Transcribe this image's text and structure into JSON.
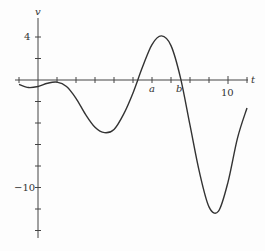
{
  "chart_data": {
    "type": "line",
    "title": "",
    "xlabel": "t",
    "ylabel": "v",
    "x_tick_labels": [
      {
        "value": 10,
        "label": "10"
      }
    ],
    "y_tick_labels": [
      {
        "value": 4,
        "label": "4"
      },
      {
        "value": -10,
        "label": "-10"
      }
    ],
    "annotations": [
      {
        "label": "a",
        "x": 6.0
      },
      {
        "label": "b",
        "x": 7.5
      }
    ],
    "x_tick_step": 1,
    "y_tick_step": 2,
    "xlim": [
      -1,
      11.5
    ],
    "ylim": [
      -14,
      5.5
    ],
    "grid": false,
    "series": [
      {
        "name": "v(t)",
        "x": [
          -1,
          -0.5,
          0,
          0.5,
          1,
          1.5,
          2,
          2.5,
          3,
          3.5,
          4,
          4.5,
          5,
          5.5,
          6,
          6.5,
          7,
          7.5,
          8,
          8.5,
          9,
          9.5,
          10,
          10.5,
          11
        ],
        "y": [
          -0.4,
          -0.7,
          -0.6,
          -0.3,
          -0.2,
          -0.6,
          -1.7,
          -3.2,
          -4.4,
          -4.9,
          -4.6,
          -3.2,
          -1.2,
          1.2,
          3.3,
          4.1,
          3.2,
          0.2,
          -4.2,
          -8.6,
          -11.8,
          -12.2,
          -9.5,
          -5.4,
          -2.6
        ]
      }
    ]
  },
  "labels": {
    "y_axis": "v",
    "x_axis": "t",
    "tick_4": "4",
    "tick_neg10": "−10",
    "tick_10": "10",
    "point_a": "a",
    "point_b": "b"
  }
}
